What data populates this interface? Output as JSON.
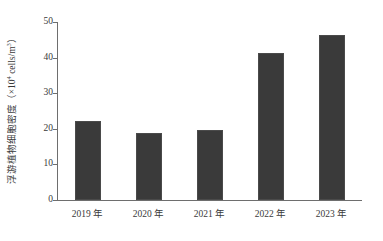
{
  "chart_data": {
    "type": "bar",
    "title": "",
    "subtitle": "",
    "categories": [
      "2019 年",
      "2020 年",
      "2021 年",
      "2022 年",
      "2023 年"
    ],
    "values": [
      22.2,
      18.8,
      19.7,
      41.3,
      46.3
    ],
    "series": [
      {
        "name": "浮游植物细胞密度",
        "values": [
          22.2,
          18.8,
          19.7,
          41.3,
          46.3
        ]
      }
    ],
    "xlabel": "",
    "ylabel": "浮游植物细胞密度（×10⁴ cells/m³）",
    "ylabel_text": "浮游植物细胞密度（×10",
    "ylabel_exponent": "4",
    "ylabel_unit_tail": " cells/m",
    "ylabel_unit_exponent": "3",
    "ylabel_close": "）",
    "ylim": [
      0,
      50
    ],
    "yticks": [
      0,
      10,
      20,
      30,
      40,
      50
    ],
    "ytick_labels": [
      "0",
      "10",
      "20",
      "30",
      "40",
      "50"
    ],
    "grid": false,
    "legend": false,
    "legend_position": "none",
    "bar_color": "#3a3a3a",
    "axis_color": "#6e6e6e",
    "background_color": "#ffffff",
    "text_color": "#3a3a3a"
  }
}
